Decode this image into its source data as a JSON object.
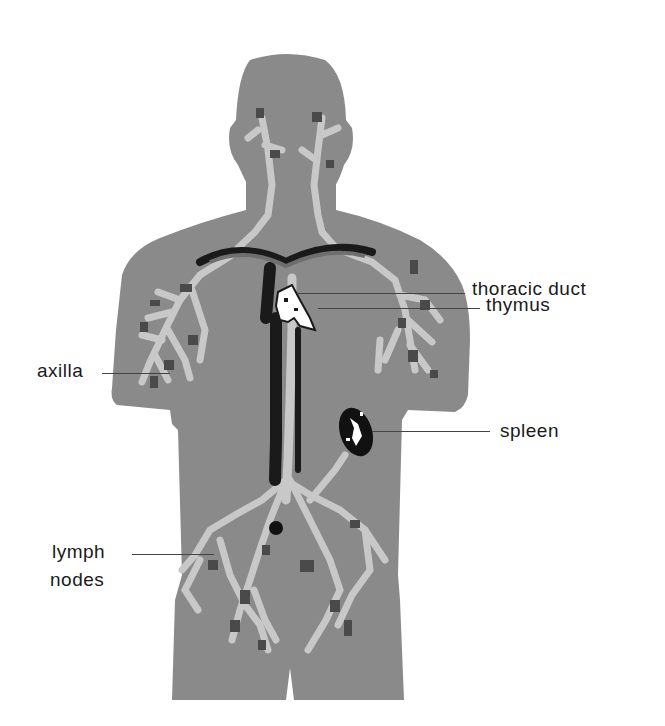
{
  "diagram": {
    "colors": {
      "body": "#8a8a8a",
      "vessels_light": "#c8c8c8",
      "vessels_dark": "#4a4a4a",
      "veins": "#1a1a1a",
      "thymus": "#ffffff",
      "spleen_outline": "#111111",
      "label_text": "#1a1a1a",
      "leader_line": "#444444",
      "background": "#ffffff"
    },
    "labels": {
      "thoracic_duct": "thoracic duct",
      "thymus": "thymus",
      "axilla": "axilla",
      "spleen": "spleen",
      "lymph_nodes_line1": "lymph",
      "lymph_nodes_line2": "nodes"
    }
  }
}
